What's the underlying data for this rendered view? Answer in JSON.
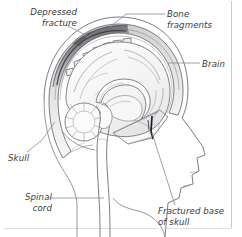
{
  "figure": {
    "kind": "medical-illustration",
    "background_color": "#ffffff",
    "border_color": "#c9c9cb",
    "ink_color": "#6e6e72",
    "label_color": "#3a3a3c",
    "shadow_color": "#4a4a4e"
  },
  "labels": {
    "depressed_fracture": "Depressed\nfracture",
    "bone_fragments": "Bone\nfragments",
    "brain": "Brain",
    "skull": "Skull",
    "spinal_cord": "Spinal\ncord",
    "fractured_base_of_skull": "Fractured base\nof skull"
  },
  "anatomy": {
    "parts": [
      "scalp-outline",
      "skull-vault",
      "diploe-hatching",
      "depressed-fracture-zone",
      "bone-fragments",
      "cerebrum",
      "corpus-callosum",
      "cerebellum",
      "brainstem",
      "spinal-cord",
      "fractured-skull-base",
      "facial-profile",
      "neck-outline"
    ]
  }
}
